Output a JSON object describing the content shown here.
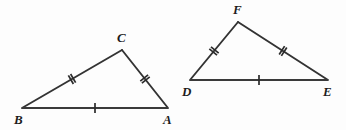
{
  "figure": {
    "name": "congruent-triangles-diagram",
    "background_color": "#fdfdfd",
    "line_color": "#333333",
    "label_color": "#1c1c1c",
    "width": 346,
    "height": 130,
    "triangles": [
      {
        "id": "triangle-abc",
        "vertices": [
          {
            "label": "B",
            "x": 22,
            "y": 108,
            "label_x": 14,
            "label_y": 124
          },
          {
            "label": "C",
            "x": 122,
            "y": 50,
            "label_x": 117,
            "label_y": 42
          },
          {
            "label": "A",
            "x": 168,
            "y": 108,
            "label_x": 163,
            "label_y": 124
          }
        ],
        "sides": [
          {
            "id": "side-bc",
            "from": "B",
            "to": "C",
            "ticks": 2
          },
          {
            "id": "side-ca",
            "from": "C",
            "to": "A",
            "ticks": 2
          },
          {
            "id": "side-ba",
            "from": "B",
            "to": "A",
            "ticks": 1
          }
        ]
      },
      {
        "id": "triangle-def",
        "vertices": [
          {
            "label": "D",
            "x": 190,
            "y": 80,
            "label_x": 182,
            "label_y": 96
          },
          {
            "label": "F",
            "x": 238,
            "y": 22,
            "label_x": 233,
            "label_y": 14
          },
          {
            "label": "E",
            "x": 328,
            "y": 80,
            "label_x": 323,
            "label_y": 96
          }
        ],
        "sides": [
          {
            "id": "side-df",
            "from": "D",
            "to": "F",
            "ticks": 2
          },
          {
            "id": "side-fe",
            "from": "F",
            "to": "E",
            "ticks": 2
          },
          {
            "id": "side-de",
            "from": "D",
            "to": "E",
            "ticks": 1
          }
        ]
      }
    ]
  }
}
